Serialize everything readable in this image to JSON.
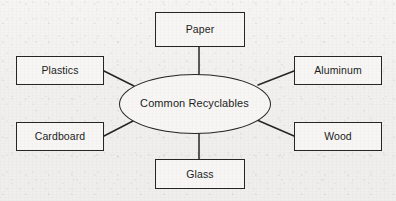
{
  "diagram": {
    "type": "concept-map",
    "center": {
      "label": "Common Recyclables",
      "shape": "ellipse",
      "cx": 194.5,
      "cy": 103.5,
      "rx": 76,
      "ry": 30
    },
    "nodes": [
      {
        "id": "paper",
        "label": "Paper",
        "x": 155,
        "y": 12,
        "w": 90,
        "h": 35
      },
      {
        "id": "aluminum",
        "label": "Aluminum",
        "x": 294,
        "y": 56,
        "w": 88,
        "h": 29
      },
      {
        "id": "wood",
        "label": "Wood",
        "x": 294,
        "y": 122,
        "w": 88,
        "h": 29
      },
      {
        "id": "glass",
        "label": "Glass",
        "x": 155,
        "y": 159,
        "w": 90,
        "h": 30
      },
      {
        "id": "cardboard",
        "label": "Cardboard",
        "x": 16,
        "y": 122,
        "w": 88,
        "h": 29
      },
      {
        "id": "plastics",
        "label": "Plastics",
        "x": 16,
        "y": 56,
        "w": 88,
        "h": 29
      }
    ],
    "connectors": [
      {
        "id": "connector-paper",
        "from": "center",
        "to": "paper",
        "x1": 199,
        "y1": 75,
        "x2": 199,
        "y2": 47
      },
      {
        "id": "connector-aluminum",
        "from": "center",
        "to": "aluminum",
        "x1": 258,
        "y1": 85,
        "x2": 294,
        "y2": 71
      },
      {
        "id": "connector-wood",
        "from": "center",
        "to": "wood",
        "x1": 257,
        "y1": 120,
        "x2": 294,
        "y2": 136
      },
      {
        "id": "connector-glass",
        "from": "center",
        "to": "glass",
        "x1": 199,
        "y1": 133,
        "x2": 199,
        "y2": 159
      },
      {
        "id": "connector-cardboard",
        "from": "center",
        "to": "cardboard",
        "x1": 133,
        "y1": 121,
        "x2": 104,
        "y2": 136
      },
      {
        "id": "connector-plastics",
        "from": "center",
        "to": "plastics",
        "x1": 134,
        "y1": 86,
        "x2": 104,
        "y2": 71
      }
    ],
    "colors": {
      "stroke": "#262626",
      "text": "#1d1d1d",
      "node_fill": "#f7f6f4",
      "page_background": "#f1f0ee"
    }
  }
}
